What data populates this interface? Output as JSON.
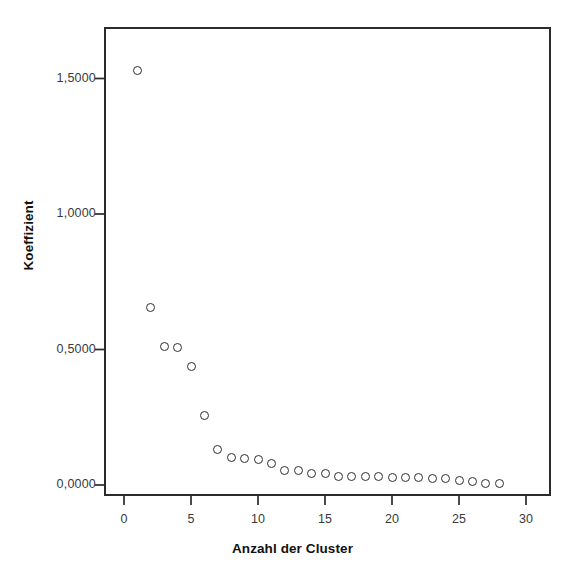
{
  "chart_data": {
    "type": "scatter",
    "title": "",
    "xlabel": "Anzahl der Cluster",
    "ylabel": "Koeffizient",
    "xlim": [
      -1.5,
      31.5
    ],
    "ylim": [
      -0.06,
      1.68
    ],
    "grid": false,
    "legend": null,
    "decimal_separator": ",",
    "x_ticks": [
      0,
      5,
      10,
      15,
      20,
      25,
      30
    ],
    "x_tick_labels": [
      "0",
      "5",
      "10",
      "15",
      "20",
      "25",
      "30"
    ],
    "y_ticks": [
      0.0,
      0.5,
      1.0,
      1.5
    ],
    "y_tick_labels": [
      "0,0000",
      "0,5000",
      "1,0000",
      "1,5000"
    ],
    "marker": "open-circle",
    "marker_color": "#2e2e2e",
    "series": [
      {
        "name": "Koeffizient",
        "x": [
          1,
          2,
          3,
          4,
          5,
          6,
          7,
          8,
          9,
          10,
          11,
          12,
          13,
          14,
          15,
          16,
          17,
          18,
          19,
          20,
          21,
          22,
          23,
          24,
          25,
          26,
          27,
          28
        ],
        "y": [
          1.53,
          0.655,
          0.512,
          0.508,
          0.438,
          0.255,
          0.132,
          0.1,
          0.096,
          0.093,
          0.078,
          0.054,
          0.052,
          0.043,
          0.042,
          0.033,
          0.032,
          0.031,
          0.03,
          0.029,
          0.028,
          0.027,
          0.025,
          0.023,
          0.018,
          0.012,
          0.007,
          0.004
        ]
      }
    ]
  },
  "axes": {
    "y_title": "Koeffizient",
    "x_title": "Anzahl der Cluster"
  },
  "colors": {
    "frame": "#2b2b2b",
    "marker": "#2e2e2e",
    "tick_text": "#3a3a3a",
    "title_text": "#111111",
    "background": "#ffffff"
  }
}
